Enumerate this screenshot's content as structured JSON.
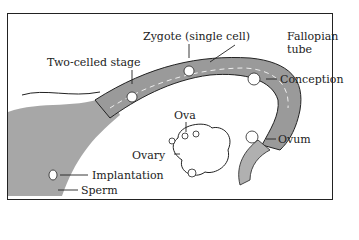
{
  "diagram": {
    "labels": {
      "zygote": "Zygote (single cell)",
      "fallopian_tube": "Fallopian\ntube",
      "fallopian_tube_line1": "Fallopian",
      "fallopian_tube_line2": "tube",
      "two_celled_stage": "Two-celled stage",
      "conception": "Conception",
      "ova": "Ova",
      "ovary": "Ovary",
      "ovum": "Ovum",
      "implantation": "Implantation",
      "sperm": "Sperm"
    },
    "colors": {
      "line": "#222222",
      "tube_fill": "#9a9a9a",
      "uterus_fill": "#8a8a8a",
      "background": "#ffffff"
    }
  }
}
